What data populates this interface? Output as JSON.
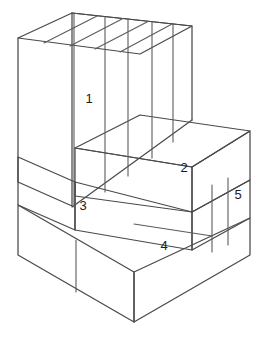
{
  "figure": {
    "background_color": "#ffffff",
    "line_color": "#5b5b5b",
    "label_color": "#1a1a1a",
    "width": 265,
    "height": 352
  },
  "labels": [
    {
      "text": "1",
      "x": 89,
      "y": 100,
      "face": "upper-block-front-face"
    },
    {
      "text": "2",
      "x": 184,
      "y": 169,
      "face": "step-ledge-front-face"
    },
    {
      "text": "3",
      "x": 83,
      "y": 207,
      "face": "middle-left-front-face"
    },
    {
      "text": "4",
      "x": 164,
      "y": 247,
      "face": "lower-right-front-face"
    },
    {
      "text": "5",
      "x": 238,
      "y": 196,
      "face": "right-side-narrow-face"
    }
  ],
  "geometry": {
    "upper_block": {
      "top_face": "18,38 72,13 192,26 140,54",
      "front_left_face": "18,38 18,182 72,206 72,13",
      "front_right_face": "72,206 192,120 192,26 72,13",
      "top_dividers": [
        "97,18 44,45",
        "122,21 70,48",
        "147,24 95,51",
        "172,25 120,53"
      ],
      "front_dividers": [
        "74,13 74,207",
        "105,16 105,191",
        "127,19 127,180",
        "152,22 152,167",
        "173,24 173,157"
      ]
    },
    "step_ledge": {
      "top_face": "75,148 140,115 250,131 192,167",
      "front_face": "75,148 75,196 192,212 192,167",
      "right_face": "192,167 250,131 250,180 192,212"
    },
    "middle_band": {
      "left_face": "18,157 18,205 75,230 75,182",
      "front_face": "75,182 75,230 192,250 192,212",
      "right_face": "192,212 250,180 250,218 192,250"
    },
    "lower_band": {
      "left_face": "18,205 18,255 134,322 134,272",
      "front_face": "134,272 134,322 250,255 250,218",
      "divider": "76,240 76,292"
    },
    "right_column_dividers": [
      "212,185 212,252",
      "228,178 228,245"
    ]
  }
}
